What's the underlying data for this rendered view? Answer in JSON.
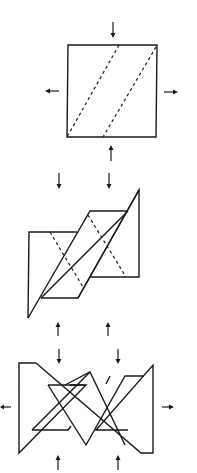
{
  "diagram": {
    "stages": [
      {
        "name": "flat-square",
        "fold_lines": "two dashed diagonal fold lines"
      },
      {
        "name": "partially-folded",
        "fold_lines": "two dashed fold lines on side panels"
      },
      {
        "name": "fully-folded",
        "fold_lines": "none"
      }
    ],
    "colors": {
      "stroke": "#1a1a1a",
      "background": "#ffffff"
    }
  }
}
